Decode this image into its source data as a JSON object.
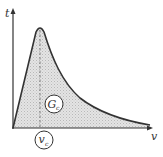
{
  "diagram": {
    "type": "traction-separation curve",
    "y_axis_label": "t",
    "x_axis_label": "v",
    "area_label": "G",
    "area_label_sub": "c",
    "peak_label": "v",
    "peak_label_sub": "c",
    "colors": {
      "curve": "#333333",
      "fill": "#d6d6d6",
      "axis": "#333333",
      "dashed": "#666666"
    }
  }
}
